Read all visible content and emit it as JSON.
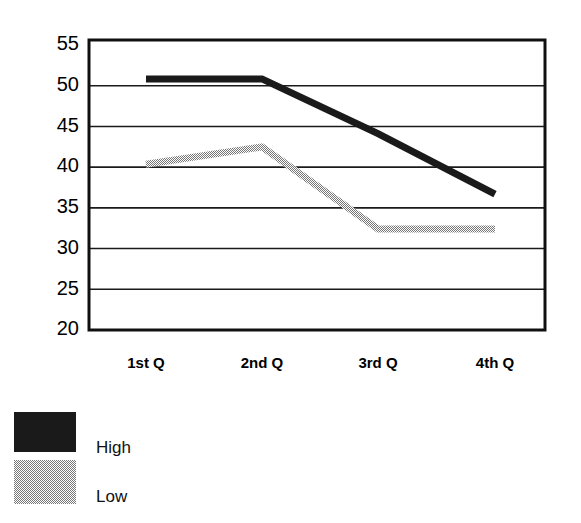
{
  "chart_data": {
    "type": "line",
    "title": "",
    "subtitle": "",
    "xlabel": "",
    "ylabel": "",
    "categories": [
      "1st Q",
      "2nd Q",
      "3rd Q",
      "4th Q"
    ],
    "ylim": [
      20,
      55
    ],
    "yticks": [
      20,
      25,
      30,
      35,
      40,
      45,
      50,
      55
    ],
    "ytick_labels": [
      "20",
      "25",
      "30",
      "35",
      "40",
      "45",
      "50",
      "55"
    ],
    "grid": "horizontal",
    "legend_position": "bottom-left",
    "series": [
      {
        "name": "High",
        "color": "#1a1a1a",
        "values": [
          50.3,
          50.3,
          43.7,
          36.4
        ]
      },
      {
        "name": "Low",
        "color": "#9a9a9a",
        "values": [
          40.0,
          42.1,
          32.2,
          32.2
        ]
      }
    ]
  },
  "legend": {
    "items": [
      {
        "label": "High",
        "swatch_color": "#1a1a1a"
      },
      {
        "label": "Low",
        "swatch_color": "#9a9a9a"
      }
    ]
  },
  "axis": {
    "frame_color": "#101010",
    "gridline_color": "#1a1a1a"
  }
}
